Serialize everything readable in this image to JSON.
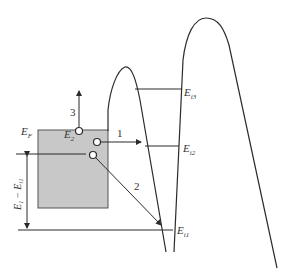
{
  "diagram": {
    "type": "energy-band-diagram",
    "colors": {
      "stroke": "#2b2b2b",
      "metal_fill": "#c8c8c8",
      "background": "#ffffff"
    },
    "labels": {
      "fermi": {
        "main": "E",
        "sub": "F"
      },
      "e2": {
        "main": "E",
        "sub": "2"
      },
      "ei1": {
        "main": "E",
        "sub": "i1"
      },
      "ei2": {
        "main": "E",
        "sub": "i2"
      },
      "ei3": {
        "main": "E",
        "sub": "i3"
      },
      "dimension": "E1 − Ei1",
      "dimension_parts": {
        "e": "E",
        "one": "1",
        "minus": " − ",
        "e2": "E",
        "i1": "i1"
      }
    },
    "arrows": [
      {
        "id": "1",
        "label": "1",
        "description": "horizontal tunneling to Ei2"
      },
      {
        "id": "2",
        "label": "2",
        "description": "diagonal transition to Ei1"
      },
      {
        "id": "3",
        "label": "3",
        "description": "vertical emission upward"
      }
    ]
  }
}
